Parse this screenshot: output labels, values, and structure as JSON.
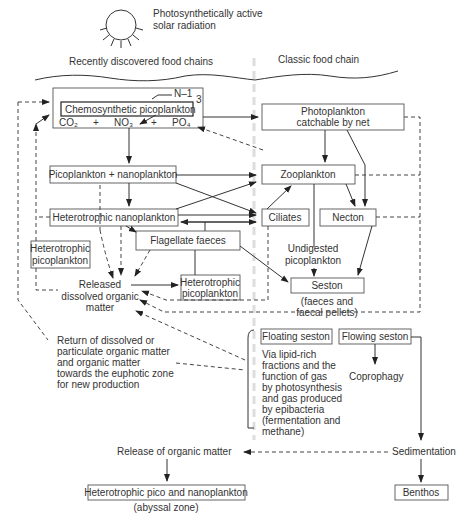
{
  "header": {
    "sun_label_line1": "Photosynthetically active",
    "sun_label_line2": "solar radiation",
    "left_heading": "Recently discovered food chains",
    "right_heading": "Classic food chain"
  },
  "nodes": {
    "chemosynthetic": "Chemosynthetic picoplankton",
    "n_label": "N–1",
    "n_sub": "3",
    "co2": "CO₂",
    "plus1": "+",
    "no3": "NO₃",
    "plus2": "+",
    "po4": "PO₄",
    "photoplankton_line1": "Photoplankton",
    "photoplankton_line2": "catchable by net",
    "pico_nano": "Picoplankton + nanoplankton",
    "zooplankton": "Zooplankton",
    "hetero_nano": "Heterotrophic nanoplankton",
    "ciliates": "Ciliates",
    "necton": "Necton",
    "hetero_pico_left_line1": "Heterotrophic",
    "hetero_pico_left_line2": "picoplankton",
    "flagellate_faeces": "Flagellate faeces",
    "undigested_line1": "Undigested",
    "undigested_line2": "picoplankton",
    "released_line1": "Released",
    "released_line2": "dissolved organic",
    "released_line3": "matter",
    "hetero_pico_mid_line1": "Heterotrophic",
    "hetero_pico_mid_line2": "picoplankton",
    "seston": "Seston",
    "seston_note_line1": "(faeces and",
    "seston_note_line2": "faecal pellets)",
    "return_lines": [
      "Return of dissolved or",
      "particulate organic matter",
      "and organic matter",
      "towards the euphotic zone",
      "for new production"
    ],
    "floating_seston": "Floating seston",
    "flowing_seston": "Flowing seston",
    "floating_desc": [
      "Via lipid-rich",
      "fractions and the",
      "function of gas",
      "by photosynthesis",
      "and gas produced",
      "by epibacteria",
      "(fermentation and",
      "methane)"
    ],
    "coprophagy": "Coprophagy",
    "release_organic": "Release of organic matter",
    "sedimentation": "Sedimentation",
    "abyssal_box": "Heterotrophic pico and nanoplankton",
    "abyssal_note": "(abyssal zone)",
    "benthos": "Benthos"
  }
}
